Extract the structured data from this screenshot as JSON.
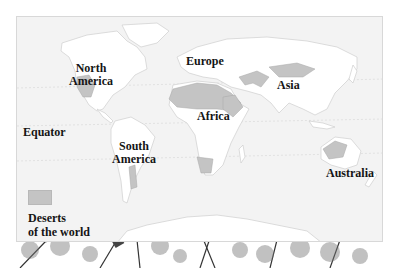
{
  "map": {
    "title": "Deserts of the world",
    "colors": {
      "ocean": "#f3f3f3",
      "land": "#ffffff",
      "desert": "#c4c4c4",
      "border": "#d8d8d8",
      "text": "#151515"
    },
    "labels": {
      "north_america": [
        "North",
        "America"
      ],
      "south_america": [
        "South",
        "America"
      ],
      "europe": "Europe",
      "asia": "Asia",
      "africa": "Africa",
      "australia": "Australia",
      "equator": "Equator"
    },
    "legend": {
      "line1": "Deserts",
      "line2": "of the world"
    }
  }
}
